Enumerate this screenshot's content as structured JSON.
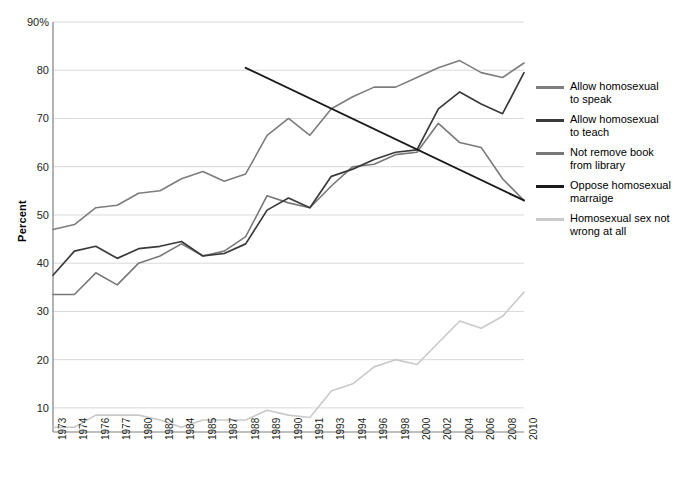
{
  "chart_data": {
    "type": "line",
    "title": "",
    "subtitle": "",
    "xlabel": "",
    "ylabel": "Percent",
    "ylim": [
      5,
      90
    ],
    "yticks": [
      "10",
      "20",
      "30",
      "40",
      "50",
      "60",
      "70",
      "80",
      "90%"
    ],
    "ytick_values": [
      10,
      20,
      30,
      40,
      50,
      60,
      70,
      80,
      90
    ],
    "grid": true,
    "legend_position": "right",
    "categories": [
      "1973",
      "1974",
      "1976",
      "1977",
      "1980",
      "1982",
      "1984",
      "1985",
      "1987",
      "1988",
      "1989",
      "1990",
      "1991",
      "1993",
      "1994",
      "1996",
      "1998",
      "2000",
      "2002",
      "2004",
      "2006",
      "2008",
      "2010"
    ],
    "series": [
      {
        "name": "Allow homosexual to speak",
        "color": "#7d7d7d",
        "values": [
          47.0,
          48.0,
          51.5,
          52.0,
          54.5,
          55.0,
          57.5,
          59.0,
          57.0,
          58.5,
          66.5,
          70.0,
          66.5,
          72.0,
          74.5,
          76.5,
          76.5,
          78.5,
          80.5,
          82.0,
          79.5,
          78.5,
          81.5
        ]
      },
      {
        "name": "Allow homosexual to teach",
        "color": "#3a3a3a",
        "values": [
          37.5,
          42.5,
          43.5,
          41.0,
          43.0,
          43.5,
          44.5,
          41.5,
          42.0,
          44.0,
          51.0,
          53.5,
          51.5,
          58.0,
          59.5,
          61.5,
          63.0,
          63.5,
          72.0,
          75.5,
          73.0,
          71.0,
          79.5
        ]
      },
      {
        "name": "Not remove book from library",
        "color": "#787878",
        "values": [
          null,
          null,
          null,
          null,
          null,
          null,
          null,
          null,
          null,
          null,
          null,
          null,
          null,
          null,
          null,
          null,
          null,
          null,
          null,
          null,
          null,
          null,
          null
        ]
      },
      {
        "name": "Oppose homosexual marriage",
        "color": "#1a1a1a",
        "values": [
          null,
          null,
          null,
          null,
          null,
          null,
          null,
          null,
          80.5,
          null,
          null,
          null,
          73.5,
          null,
          70.5,
          67.0,
          66.0,
          64.5,
          60.0,
          57.5,
          51.5,
          null,
          null
        ]
      },
      {
        "name": "Homosexual sex not wrong at all",
        "color": "#c9c9c9",
        "values": [
          6.0,
          6.0,
          8.5,
          8.5,
          8.5,
          7.5,
          6.0,
          7.5,
          7.5,
          7.5,
          9.5,
          8.5,
          8.0,
          13.5,
          15.0,
          18.5,
          20.0,
          19.0,
          23.5,
          28.0,
          26.5,
          29.0,
          34.0
        ]
      }
    ],
    "series_book": {
      "name": "Not remove book from library",
      "color": "#787878",
      "categories": [
        "1973",
        "1974",
        "1976",
        "1977",
        "1980",
        "1982",
        "1984",
        "1985",
        "1987",
        "1988",
        "1989",
        "1990",
        "1991",
        "1993",
        "1994",
        "1996",
        "1998",
        "2000",
        "2002",
        "2004",
        "2006",
        "2008",
        "2010"
      ],
      "values": [
        33.5,
        33.5,
        38.0,
        35.5,
        40.0,
        41.5,
        44.0,
        41.5,
        42.5,
        45.5,
        54.0,
        52.5,
        51.5,
        56.0,
        60.0,
        60.5,
        62.5,
        63.0,
        69.0,
        65.0,
        64.0,
        57.5,
        53.0
      ]
    },
    "series_oppose_full": {
      "name": "Oppose homosexual marriage",
      "color": "#1a1a1a",
      "x": [
        "1988",
        "2010"
      ],
      "values": [
        80.5,
        53.0
      ]
    }
  },
  "axis": {
    "y_label": "Percent",
    "y_ticks": [
      "90%",
      "80",
      "70",
      "60",
      "50",
      "40",
      "30",
      "20",
      "10"
    ],
    "x_ticks": [
      "1973",
      "1974",
      "1976",
      "1977",
      "1980",
      "1982",
      "1984",
      "1985",
      "1987",
      "1988",
      "1989",
      "1990",
      "1991",
      "1993",
      "1994",
      "1996",
      "1998",
      "2000",
      "2002",
      "2004",
      "2006",
      "2008",
      "2010"
    ]
  },
  "legend": {
    "items": [
      {
        "label_line1": "Allow homosexual",
        "label_line2": "to speak",
        "color": "#7d7d7d"
      },
      {
        "label_line1": "Allow homosexual",
        "label_line2": "to teach",
        "color": "#3a3a3a"
      },
      {
        "label_line1": "Not remove book",
        "label_line2": "from library",
        "color": "#787878"
      },
      {
        "label_line1": "Oppose homosexual",
        "label_line2": "marraige",
        "color": "#1a1a1a"
      },
      {
        "label_line1": "Homosexual sex not",
        "label_line2": "wrong at all",
        "color": "#c9c9c9"
      }
    ]
  },
  "colors": {
    "grid": "#d9d9d9",
    "axis": "#808080",
    "text": "#231f20",
    "background": "#ffffff"
  }
}
